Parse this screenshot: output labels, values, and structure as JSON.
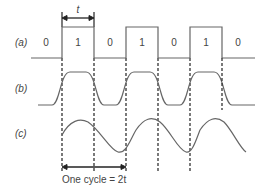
{
  "diagram": {
    "rows": [
      {
        "label": "(a)",
        "description": "binary square wave"
      },
      {
        "label": "(b)",
        "description": "rounded pulse waveform"
      },
      {
        "label": "(c)",
        "description": "sinusoidal fundamental"
      }
    ],
    "bits": [
      "0",
      "1",
      "0",
      "1",
      "0",
      "1",
      "0"
    ],
    "bit_period_label": "t",
    "cycle_label": "One cycle = 2t",
    "colors": {
      "line": "#666666",
      "text": "#444444"
    }
  }
}
